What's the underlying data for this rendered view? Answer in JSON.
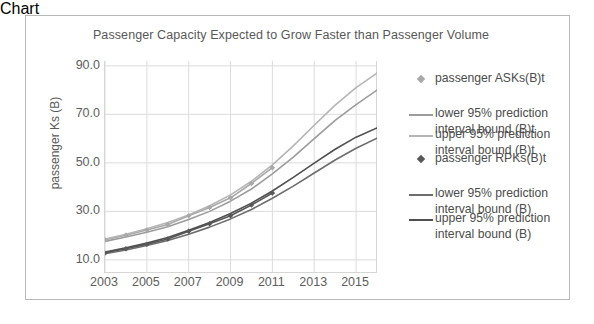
{
  "chart_data": {
    "type": "line",
    "title": "Passenger Capacity Expected to Grow Faster than Passenger Volume",
    "xlabel": "",
    "ylabel": "passenger Ks (B)",
    "xlim": [
      2003,
      2016
    ],
    "ylim": [
      5,
      92
    ],
    "yticks": [
      "10.0",
      "30.0",
      "50.0",
      "70.0",
      "90.0"
    ],
    "ytick_values": [
      10,
      30,
      50,
      70,
      90
    ],
    "xticks": [
      "2003",
      "2005",
      "2007",
      "2009",
      "2011",
      "2013",
      "2015"
    ],
    "xtick_values": [
      2003,
      2005,
      2007,
      2009,
      2011,
      2013,
      2015
    ],
    "grid": true,
    "legend_position": "right",
    "x": [
      2003,
      2004,
      2005,
      2006,
      2007,
      2008,
      2009,
      2010,
      2011,
      2012,
      2013,
      2014,
      2015,
      2016
    ],
    "series": [
      {
        "name": "passenger ASKs(B)t",
        "marker": "diamond",
        "color": "#a8a8a8",
        "values": [
          18.3,
          20.2,
          22.3,
          24.6,
          28.2,
          31.6,
          35.6,
          41.5,
          48.0,
          null,
          null,
          null,
          null,
          null
        ]
      },
      {
        "name": "lower 95% prediction interval bound (B)t",
        "marker": "line",
        "color": "#9c9c9c",
        "values": [
          17.6,
          19.4,
          21.4,
          23.7,
          26.6,
          30.0,
          34.2,
          39.2,
          45.5,
          52.4,
          60.0,
          67.5,
          74.0,
          80.0
        ]
      },
      {
        "name": "upper 95% prediction interval bound (B)t",
        "marker": "line",
        "color": "#b5b5b5",
        "values": [
          18.6,
          20.6,
          22.8,
          25.4,
          28.5,
          32.3,
          36.8,
          42.4,
          49.2,
          57.0,
          65.5,
          73.8,
          81.0,
          87.0
        ]
      },
      {
        "name": "passenger RPKs(B)t",
        "marker": "diamond",
        "color": "#585858",
        "values": [
          12.8,
          14.6,
          16.4,
          18.6,
          21.8,
          24.9,
          28.2,
          32.6,
          37.6,
          null,
          null,
          null,
          null,
          null
        ]
      },
      {
        "name": "lower 95% prediction interval bound (B)",
        "marker": "line",
        "color": "#6d6d6d",
        "values": [
          12.5,
          14.1,
          15.9,
          18.0,
          20.6,
          23.5,
          26.9,
          30.8,
          35.4,
          40.4,
          45.8,
          51.2,
          56.0,
          60.2
        ]
      },
      {
        "name": "upper 95% prediction interval bound (B)",
        "marker": "line",
        "color": "#505050",
        "values": [
          13.2,
          15.0,
          16.9,
          19.2,
          22.2,
          25.4,
          29.1,
          33.4,
          38.4,
          44.0,
          49.9,
          55.6,
          60.6,
          64.4
        ]
      }
    ]
  },
  "legend": {
    "entries": [
      {
        "label": "passenger ASKs(B)t",
        "key": "diamond-marker-light",
        "line2": ""
      },
      {
        "label": "lower 95% prediction",
        "key": "line-swatch-light",
        "line2": "interval bound (B)t"
      },
      {
        "label": "upper 95% prediction",
        "key": "line-swatch-lighter",
        "line2": "interval bound (B)t"
      },
      {
        "label": "passenger RPKs(B)t",
        "key": "diamond-marker-dark",
        "line2": ""
      },
      {
        "label": "lower 95% prediction",
        "key": "line-swatch-dark",
        "line2": "interval bound (B)"
      },
      {
        "label": "upper 95% prediction",
        "key": "line-swatch-darker",
        "line2": "interval bound (B)"
      }
    ]
  },
  "colors": {
    "ask_marker": "#a8a8a8",
    "ask_lower": "#9c9c9c",
    "ask_upper": "#b5b5b5",
    "rpk_marker": "#585858",
    "rpk_lower": "#6d6d6d",
    "rpk_upper": "#505050",
    "grid": "#dcdcdc",
    "text": "#5a5a5a",
    "frame": "#b9b9b9"
  }
}
